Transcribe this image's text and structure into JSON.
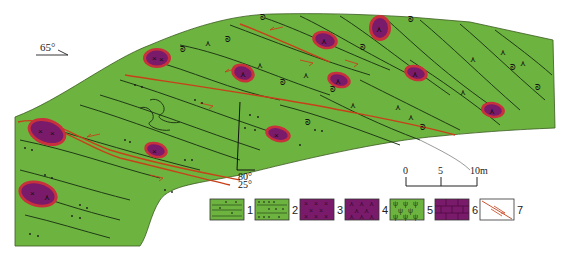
{
  "orientation": {
    "strike_label": "65°"
  },
  "measurement": {
    "dip_upper": "80°",
    "dip_lower": "25°"
  },
  "scale_bar": {
    "ticks": [
      "0",
      "5",
      "10m"
    ]
  },
  "legend": {
    "items": [
      {
        "num": "1",
        "pattern": "green-lines-dots"
      },
      {
        "num": "2",
        "pattern": "green-dense-dots"
      },
      {
        "num": "3",
        "pattern": "purple-x"
      },
      {
        "num": "4",
        "pattern": "purple-caret"
      },
      {
        "num": "5",
        "pattern": "green-psi"
      },
      {
        "num": "6",
        "pattern": "purple-brick"
      },
      {
        "num": "7",
        "pattern": "fault-arrows"
      }
    ]
  },
  "colors": {
    "rock_green": "#6db33f",
    "lens_purple": "#7a1a6a",
    "lens_rim": "#c8303c",
    "fault_red": "#c8401a",
    "line_dark": "#1f3a16"
  }
}
